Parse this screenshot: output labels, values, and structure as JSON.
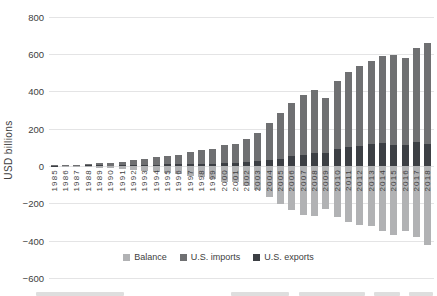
{
  "y_axis": {
    "title": "USD billions",
    "ticks": [
      800,
      600,
      400,
      200,
      0,
      -200,
      -400,
      -600
    ],
    "min": -600,
    "max": 800
  },
  "legend": {
    "position": "bottom",
    "items": [
      "Balance",
      "U.S. imports",
      "U.S. exports"
    ]
  },
  "colors": {
    "balance": "#b1b2b4",
    "imports": "#6f7072",
    "exports": "#3c3f44",
    "gridline": "#e4e4e5",
    "axis_text": "#404040",
    "background": "#ffffff"
  },
  "chart_data": {
    "type": "bar",
    "stacked": true,
    "title": "",
    "xlabel": "",
    "ylabel": "USD billions",
    "ylim": [
      -600,
      800
    ],
    "grid": true,
    "legend_position": "bottom",
    "categories": [
      1985,
      1986,
      1987,
      1988,
      1989,
      1990,
      1991,
      1992,
      1993,
      1994,
      1995,
      1996,
      1997,
      1998,
      1999,
      2000,
      2001,
      2002,
      2003,
      2004,
      2005,
      2006,
      2007,
      2008,
      2009,
      2010,
      2011,
      2012,
      2013,
      2014,
      2015,
      2016,
      2017,
      2018
    ],
    "series": [
      {
        "name": "Balance",
        "color": "#b1b2b4",
        "values": [
          0.0,
          -1.7,
          -2.8,
          -3.5,
          -6.2,
          -10.4,
          -12.7,
          -18.3,
          -22.8,
          -29.5,
          -33.8,
          -39.5,
          -49.7,
          -56.9,
          -68.7,
          -83.8,
          -83.1,
          -103.1,
          -124.0,
          -162.3,
          -202.3,
          -234.1,
          -258.5,
          -268.0,
          -226.9,
          -273.0,
          -295.3,
          -315.1,
          -318.7,
          -344.8,
          -367.3,
          -347.0,
          -375.6,
          -419.2
        ]
      },
      {
        "name": "U.S. imports",
        "color": "#6f7072",
        "values": [
          3.9,
          4.8,
          6.3,
          8.5,
          12.0,
          15.2,
          19.0,
          25.7,
          31.5,
          38.8,
          45.6,
          51.5,
          62.6,
          71.2,
          81.8,
          100.0,
          102.3,
          125.2,
          152.4,
          196.7,
          243.5,
          287.8,
          321.4,
          337.8,
          296.4,
          364.9,
          399.4,
          425.6,
          440.4,
          468.5,
          483.2,
          462.6,
          505.5,
          539.5
        ]
      },
      {
        "name": "U.S. exports",
        "color": "#3c3f44",
        "values": [
          3.9,
          3.1,
          3.5,
          5.0,
          5.8,
          4.8,
          6.3,
          7.4,
          8.8,
          9.3,
          11.7,
          12.0,
          12.8,
          14.2,
          13.1,
          16.2,
          19.2,
          22.1,
          28.4,
          34.4,
          41.2,
          53.7,
          62.9,
          69.7,
          69.5,
          91.9,
          104.1,
          110.5,
          121.7,
          123.7,
          115.9,
          115.6,
          129.9,
          120.3
        ]
      }
    ]
  }
}
